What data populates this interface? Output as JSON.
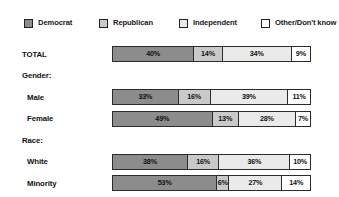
{
  "chart_data": {
    "type": "bar",
    "orientation": "horizontal",
    "stacked": true,
    "title": "",
    "subtitle": "",
    "xlabel": "",
    "ylabel": "",
    "xlim": [
      0,
      100
    ],
    "grid": false,
    "legend_position": "top",
    "value_suffix": "%",
    "categories": [
      "TOTAL",
      "Male",
      "Female",
      "White",
      "Minority"
    ],
    "group_headers": [
      "Gender:",
      "Race:"
    ],
    "series": [
      {
        "name": "Democrat",
        "color": "#8c8c8c",
        "values": [
          40,
          33,
          49,
          38,
          53
        ]
      },
      {
        "name": "Republican",
        "color": "#c9c9c9",
        "values": [
          14,
          16,
          13,
          16,
          6
        ]
      },
      {
        "name": "Independent",
        "color": "#eaeaea",
        "values": [
          34,
          39,
          28,
          36,
          27
        ]
      },
      {
        "name": "Other/Don't know",
        "color": "#ffffff",
        "values": [
          9,
          11,
          7,
          10,
          14
        ]
      }
    ]
  },
  "legend": {
    "items": [
      {
        "label": "Democrat",
        "swatch": "legend-swatch-democrat"
      },
      {
        "label": "Republican",
        "swatch": "legend-swatch-republican"
      },
      {
        "label": "Independent",
        "swatch": "legend-swatch-independent"
      },
      {
        "label": "Other/Don't know",
        "swatch": "legend-swatch-other"
      }
    ]
  },
  "rows": [
    {
      "kind": "data",
      "label": "TOTAL",
      "segments": [
        {
          "series": "Democrat",
          "value": "40%"
        },
        {
          "series": "Republican",
          "value": "14%"
        },
        {
          "series": "Independent",
          "value": "34%"
        },
        {
          "series": "Other/Don't know",
          "value": "9%"
        }
      ]
    },
    {
      "kind": "group",
      "label": "Gender:"
    },
    {
      "kind": "data",
      "label": "Male",
      "segments": [
        {
          "series": "Democrat",
          "value": "33%"
        },
        {
          "series": "Republican",
          "value": "16%"
        },
        {
          "series": "Independent",
          "value": "39%"
        },
        {
          "series": "Other/Don't know",
          "value": "11%"
        }
      ]
    },
    {
      "kind": "data",
      "label": "Female",
      "segments": [
        {
          "series": "Democrat",
          "value": "49%"
        },
        {
          "series": "Republican",
          "value": "13%"
        },
        {
          "series": "Independent",
          "value": "28%"
        },
        {
          "series": "Other/Don't know",
          "value": "7%"
        }
      ]
    },
    {
      "kind": "group",
      "label": "Race:"
    },
    {
      "kind": "data",
      "label": "White",
      "segments": [
        {
          "series": "Democrat",
          "value": "38%"
        },
        {
          "series": "Republican",
          "value": "16%"
        },
        {
          "series": "Independent",
          "value": "36%"
        },
        {
          "series": "Other/Don't know",
          "value": "10%"
        }
      ]
    },
    {
      "kind": "data",
      "label": "Minority",
      "segments": [
        {
          "series": "Democrat",
          "value": "53%"
        },
        {
          "series": "Republican",
          "value": "6%"
        },
        {
          "series": "Independent",
          "value": "27%"
        },
        {
          "series": "Other/Don't know",
          "value": "14%"
        }
      ]
    }
  ]
}
